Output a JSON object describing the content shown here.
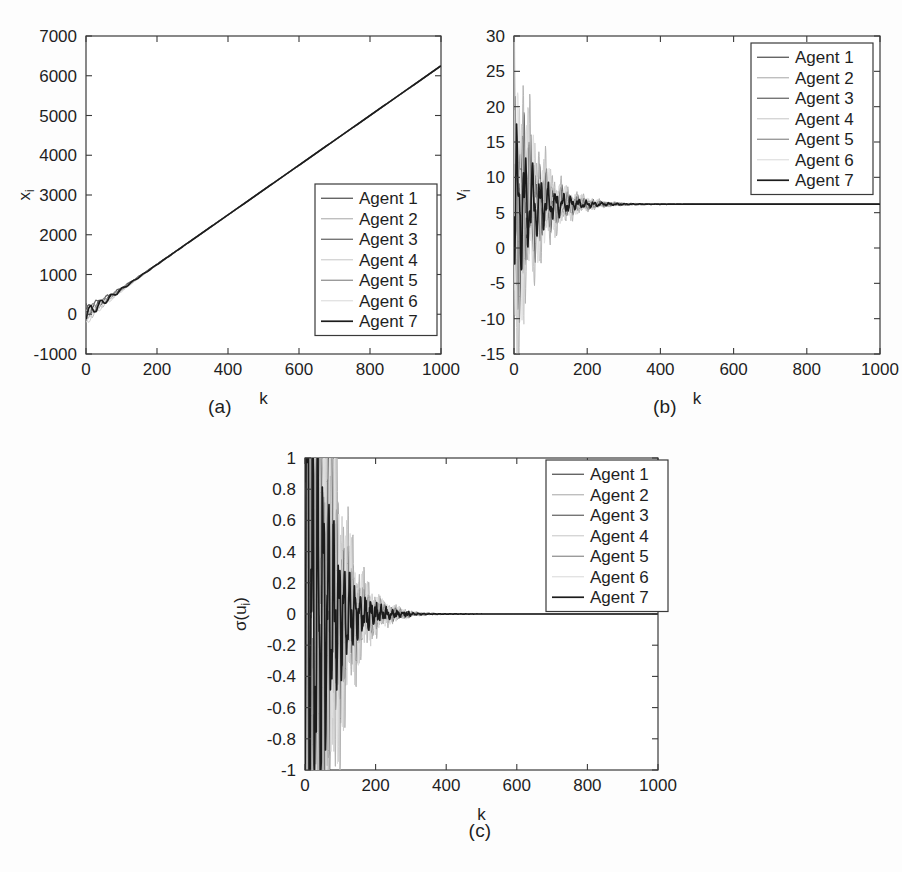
{
  "figure": {
    "background": "#fdfdfd",
    "axis_color": "#3a3a3a",
    "captions": {
      "a": "(a)",
      "b": "(b)",
      "c": "(c)"
    }
  },
  "series_styles": [
    {
      "name": "Agent 1",
      "color": "#4a4a4a",
      "width": 1.1
    },
    {
      "name": "Agent 2",
      "color": "#b4b4b4",
      "width": 1.0
    },
    {
      "name": "Agent 3",
      "color": "#5e5e5e",
      "width": 1.2
    },
    {
      "name": "Agent 4",
      "color": "#cfcfcf",
      "width": 1.0
    },
    {
      "name": "Agent 5",
      "color": "#8a8a8a",
      "width": 1.1
    },
    {
      "name": "Agent 6",
      "color": "#dedede",
      "width": 1.0
    },
    {
      "name": "Agent 7",
      "color": "#1c1c1c",
      "width": 1.7
    }
  ],
  "chart_data": [
    {
      "id": "a",
      "type": "line",
      "title": "",
      "xlabel": "k",
      "ylabel": "x",
      "ylabel_sub": "i",
      "xlim": [
        0,
        1000
      ],
      "ylim": [
        -1000,
        7000
      ],
      "xticks": [
        0,
        200,
        400,
        600,
        800,
        1000
      ],
      "yticks": [
        -1000,
        0,
        1000,
        2000,
        3000,
        4000,
        5000,
        6000,
        7000
      ],
      "xtick_labels": [
        "0",
        "200",
        "400",
        "600",
        "800",
        "1000"
      ],
      "ytick_labels": [
        "-1000",
        "0",
        "1000",
        "2000",
        "3000",
        "4000",
        "5000",
        "6000",
        "7000"
      ],
      "grid": false,
      "legend": {
        "position": "inside-right-lower",
        "entries": [
          "Agent 1",
          "Agent 2",
          "Agent 3",
          "Agent 4",
          "Agent 5",
          "Agent 6",
          "Agent 7"
        ]
      },
      "description": "Positions of seven agents grow linearly to about 6300 at k=1000 after a short oscillatory transient near k<150.",
      "model": {
        "kind": "position",
        "slope": 6.25,
        "settle_k": 150,
        "transient_amp": 180,
        "transient_period": 30,
        "transient_decay": 55,
        "offsets": [
          40,
          -70,
          90,
          -110,
          25,
          -40,
          0
        ]
      }
    },
    {
      "id": "b",
      "type": "line",
      "title": "",
      "xlabel": "k",
      "ylabel": "v",
      "ylabel_sub": "i",
      "xlim": [
        0,
        1000
      ],
      "ylim": [
        -15,
        30
      ],
      "xticks": [
        0,
        200,
        400,
        600,
        800,
        1000
      ],
      "yticks": [
        -15,
        -10,
        -5,
        0,
        5,
        10,
        15,
        20,
        25,
        30
      ],
      "xtick_labels": [
        "0",
        "200",
        "400",
        "600",
        "800",
        "1000"
      ],
      "ytick_labels": [
        "-15",
        "-10",
        "-5",
        "0",
        "5",
        "10",
        "15",
        "20",
        "25",
        "30"
      ],
      "grid": false,
      "legend": {
        "position": "inside-top-right",
        "entries": [
          "Agent 1",
          "Agent 2",
          "Agent 3",
          "Agent 4",
          "Agent 5",
          "Agent 6",
          "Agent 7"
        ]
      },
      "description": "Velocities oscillate strongly between about -10 and 26 for k<200 then damp and converge to a common value near 6.2 by k=350.",
      "model": {
        "kind": "velocity",
        "final": 6.2,
        "decay": 62,
        "period": 21,
        "amplitudes": [
          13.5,
          20.0,
          11.0,
          17.5,
          9.5,
          15.0,
          8.5
        ],
        "phases": [
          0.0,
          0.9,
          1.8,
          2.6,
          3.5,
          4.3,
          5.2
        ],
        "starts": [
          5.0,
          -9.5,
          10.0,
          -6.0,
          8.0,
          19.5,
          4.5
        ]
      }
    },
    {
      "id": "c",
      "type": "line",
      "title": "",
      "xlabel": "k",
      "ylabel": "σ(u",
      "ylabel_sub": "i",
      "ylabel_tail": ")",
      "xlim": [
        0,
        1000
      ],
      "ylim": [
        -1,
        1
      ],
      "xticks": [
        0,
        200,
        400,
        600,
        800,
        1000
      ],
      "yticks": [
        -1,
        -0.8,
        -0.6,
        -0.4,
        -0.2,
        0,
        0.2,
        0.4,
        0.6,
        0.8,
        1
      ],
      "xtick_labels": [
        "0",
        "200",
        "400",
        "600",
        "800",
        "1000"
      ],
      "ytick_labels": [
        "-1",
        "-0.8",
        "-0.6",
        "-0.4",
        "-0.2",
        "0",
        "0.2",
        "0.4",
        "0.6",
        "0.8",
        "1"
      ],
      "grid": false,
      "legend": {
        "position": "inside-top-right",
        "entries": [
          "Agent 1",
          "Agent 2",
          "Agent 3",
          "Agent 4",
          "Agent 5",
          "Agent 6",
          "Agent 7"
        ]
      },
      "description": "Saturated control inputs swing between the limits -1 and 1 for k below about 160, then decay through damped oscillations to zero by k=400.",
      "model": {
        "kind": "control",
        "saturate_until": 160,
        "decay": 52,
        "period": 15,
        "amplitudes": [
          3.2,
          5.0,
          2.7,
          4.4,
          2.3,
          3.8,
          2.0
        ],
        "phases": [
          0.0,
          0.85,
          1.7,
          2.55,
          3.4,
          4.25,
          5.1
        ]
      }
    }
  ]
}
